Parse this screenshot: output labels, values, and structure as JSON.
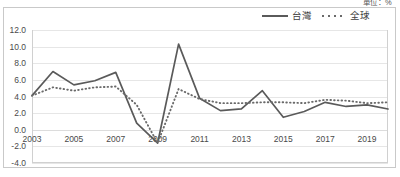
{
  "unit_caption": "單位：%",
  "legend": {
    "position": "top-right",
    "entries": [
      {
        "label": "台灣",
        "style": "solid",
        "icon": "solid-line-icon",
        "color": "#5a5a5a"
      },
      {
        "label": "全球",
        "style": "dotted",
        "icon": "dotted-line-icon",
        "color": "#6a6a6a"
      }
    ]
  },
  "axis": {
    "y_ticks": [
      "12.0",
      "10.0",
      "8.0",
      "6.0",
      "4.0",
      "2.0",
      "0.0",
      "-2.0",
      "-4.0"
    ],
    "x_ticks": [
      "2003",
      "2005",
      "2007",
      "2009",
      "2011",
      "2013",
      "2015",
      "2017",
      "2019"
    ]
  },
  "chart_data": {
    "type": "line",
    "title": "",
    "subtitle": "",
    "xlabel": "",
    "ylabel": "",
    "unit": "%",
    "grid": true,
    "legend_position": "top-right",
    "ylim": [
      -4.0,
      12.0
    ],
    "ytick_step": 2.0,
    "xlim": [
      2003,
      2020
    ],
    "xtick_step": 2,
    "categories": [
      2003,
      2004,
      2005,
      2006,
      2007,
      2008,
      2009,
      2010,
      2011,
      2012,
      2013,
      2014,
      2015,
      2016,
      2017,
      2018,
      2019,
      2020
    ],
    "series": [
      {
        "name": "台灣",
        "style": "solid",
        "color": "#5a5a5a",
        "values": [
          4.1,
          7.0,
          5.4,
          5.9,
          6.9,
          0.8,
          -1.6,
          10.3,
          3.8,
          2.3,
          2.5,
          4.7,
          1.5,
          2.2,
          3.3,
          2.8,
          3.0,
          2.5
        ]
      },
      {
        "name": "全球",
        "style": "dotted",
        "color": "#6a6a6a",
        "values": [
          4.1,
          5.1,
          4.7,
          5.1,
          5.2,
          3.0,
          -1.6,
          4.9,
          3.7,
          3.2,
          3.2,
          3.3,
          3.3,
          3.2,
          3.6,
          3.5,
          3.2,
          3.3
        ]
      }
    ]
  }
}
